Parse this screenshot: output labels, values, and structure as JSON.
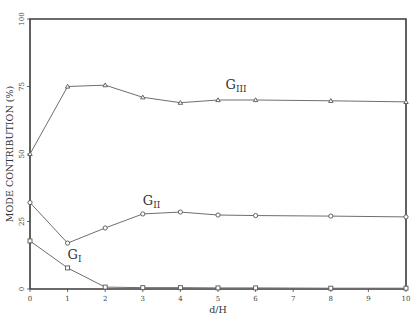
{
  "chart_data": {
    "type": "line",
    "title": "",
    "xlabel": "d/H",
    "ylabel": "MODE CONTRIBUTION (%)",
    "xlim": [
      0,
      10
    ],
    "ylim": [
      0,
      100
    ],
    "grid": false,
    "legend": "none (inline series labels)",
    "x_ticks": [
      "0",
      "1",
      "2",
      "3",
      "4",
      "5",
      "6",
      "7",
      "8",
      "9",
      "10"
    ],
    "y_ticks": [
      "0",
      "25",
      "50",
      "75",
      "100"
    ],
    "x": [
      0,
      1,
      2,
      3,
      4,
      5,
      6,
      8,
      10
    ],
    "series": [
      {
        "name": "GIII",
        "label_main": "G",
        "label_sub": "III",
        "marker": "triangle",
        "values": [
          50,
          75,
          75.5,
          71,
          69,
          70,
          70,
          69.7,
          69.3
        ]
      },
      {
        "name": "GII",
        "label_main": "G",
        "label_sub": "II",
        "marker": "circle",
        "values": [
          32,
          17,
          22.6,
          27.8,
          28.5,
          27.4,
          27.2,
          27,
          26.7
        ]
      },
      {
        "name": "GI",
        "label_main": "G",
        "label_sub": "I",
        "marker": "square",
        "values": [
          17.8,
          7.8,
          0.7,
          0.5,
          0.5,
          0.4,
          0.4,
          0.3,
          0.3
        ]
      }
    ],
    "annotations": [
      {
        "text": "GIII",
        "x": 5.2,
        "y": 74
      },
      {
        "text": "GII",
        "x": 3.0,
        "y": 31
      },
      {
        "text": "GI",
        "x": 1.0,
        "y": 11
      }
    ]
  }
}
